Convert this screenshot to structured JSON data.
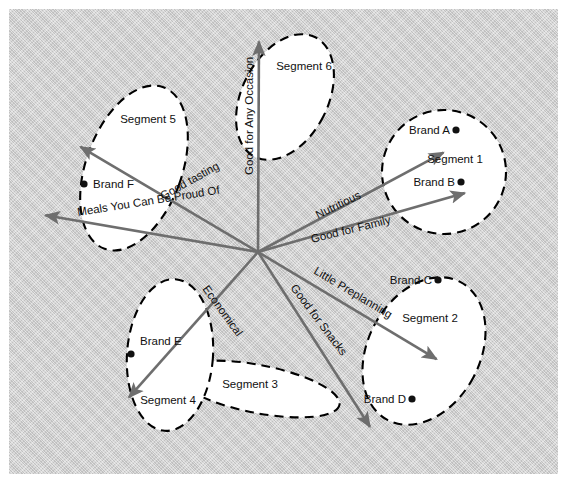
{
  "canvas": {
    "width": 567,
    "height": 484,
    "panel_color": "#c9c9c9",
    "background_color": "#ffffff"
  },
  "chart_data": {
    "type": "scatter",
    "xlabel": "",
    "ylabel": "",
    "origin": {
      "x": 258,
      "y": 252
    },
    "attribute_vectors": [
      {
        "label": "Good for Any Occasion",
        "tip_x": 259,
        "tip_y": 34,
        "angle_deg": 90,
        "label_rotation": -90,
        "label_x": 253,
        "label_y": 175
      },
      {
        "label": "Nutritious",
        "tip_x": 450,
        "tip_y": 149,
        "angle_deg": 28,
        "label_rotation": -26,
        "label_x": 318,
        "label_y": 219
      },
      {
        "label": "Good for Family",
        "tip_x": 472,
        "tip_y": 191,
        "angle_deg": 16,
        "label_rotation": -14,
        "label_x": 312,
        "label_y": 243
      },
      {
        "label": "Little Preplanning",
        "tip_x": 443,
        "tip_y": 363,
        "angle_deg": -31,
        "label_rotation": 31,
        "label_x": 313,
        "label_y": 273
      },
      {
        "label": "Good for Snacks",
        "tip_x": 374,
        "tip_y": 433,
        "angle_deg": -51,
        "label_rotation": 53,
        "label_x": 290,
        "label_y": 288
      },
      {
        "label": "Economical",
        "tip_x": 124,
        "tip_y": 403,
        "angle_deg": -136,
        "label_rotation": 54,
        "label_x": 202,
        "label_y": 289
      },
      {
        "label": "Meals You Can Be Proud Of",
        "tip_x": 38,
        "tip_y": 214,
        "angle_deg": 170,
        "label_rotation": -9,
        "label_x": 78,
        "label_y": 216
      },
      {
        "label": "Good tasting",
        "tip_x": 74,
        "tip_y": 143,
        "angle_deg": 149,
        "label_rotation": -29,
        "label_x": 163,
        "label_y": 200
      }
    ],
    "segments": [
      {
        "name": "Segment 1",
        "label_x": 455,
        "label_y": 163,
        "shape": "circle",
        "cx": 444,
        "cy": 172,
        "r": 62,
        "rot": 0
      },
      {
        "name": "Segment 2",
        "label_x": 430,
        "label_y": 322,
        "shape": "ellipse",
        "cx": 424,
        "cy": 351,
        "rx": 56,
        "ry": 78,
        "rot": 28
      },
      {
        "name": "Segment 3",
        "label_x": 250,
        "label_y": 388,
        "shape": "ellipse",
        "cx": 258,
        "cy": 389,
        "rx": 83,
        "ry": 24,
        "rot": 11
      },
      {
        "name": "Segment 4",
        "label_x": 168,
        "label_y": 404,
        "shape": "ellipse",
        "cx": 170,
        "cy": 355,
        "rx": 43,
        "ry": 76,
        "rot": 4
      },
      {
        "name": "Segment 5",
        "label_x": 148,
        "label_y": 123,
        "shape": "ellipse",
        "cx": 134,
        "cy": 168,
        "rx": 48,
        "ry": 86,
        "rot": 20
      },
      {
        "name": "Segment 6",
        "label_x": 304,
        "label_y": 70,
        "shape": "ellipse",
        "cx": 285,
        "cy": 97,
        "rx": 43,
        "ry": 67,
        "rot": 27
      }
    ],
    "brands": [
      {
        "name": "Brand A",
        "dot_x": 456,
        "dot_y": 130,
        "label_x": 450,
        "label_y": 134,
        "label_anchor": "end",
        "dot_side": "right"
      },
      {
        "name": "Brand B",
        "dot_x": 461,
        "dot_y": 182,
        "label_x": 455,
        "label_y": 186,
        "label_anchor": "end",
        "dot_side": "right"
      },
      {
        "name": "Brand C",
        "dot_x": 438,
        "dot_y": 280,
        "label_x": 432,
        "label_y": 284,
        "label_anchor": "end",
        "dot_side": "right"
      },
      {
        "name": "Brand D",
        "dot_x": 412,
        "dot_y": 399,
        "label_x": 406,
        "label_y": 403,
        "label_anchor": "end",
        "dot_side": "right"
      },
      {
        "name": "Brand E",
        "dot_x": 131,
        "dot_y": 354,
        "label_x": 140,
        "label_y": 345,
        "label_anchor": "start",
        "dot_side": "left"
      },
      {
        "name": "Brand F",
        "dot_x": 84,
        "dot_y": 184,
        "label_x": 93,
        "label_y": 188,
        "label_anchor": "start",
        "dot_side": "left"
      }
    ],
    "colors": {
      "vector": "#6e6e6e",
      "segment_outline": "#000000",
      "segment_fill": "#ffffff",
      "brand_dot": "#111111",
      "text": "#111111"
    }
  }
}
